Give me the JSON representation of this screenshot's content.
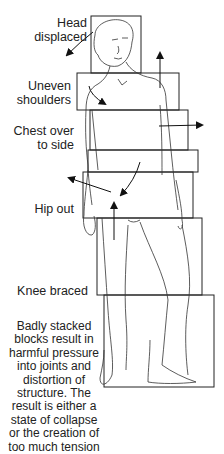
{
  "labels": {
    "head": "Head displaced",
    "shoulders_1": "Uneven",
    "shoulders_2": "shoulders",
    "chest_1": "Chest over",
    "chest_2": "to side",
    "hip": "Hip out",
    "knee": "Knee braced"
  },
  "caption": [
    "Badly stacked",
    "blocks result in",
    "harmful pressure",
    "into joints and",
    "distortion of",
    "structure. The",
    "result is either a",
    "state of collapse",
    "or the creation of",
    "too much tension"
  ],
  "colors": {
    "line": "#222222",
    "background": "#ffffff"
  }
}
